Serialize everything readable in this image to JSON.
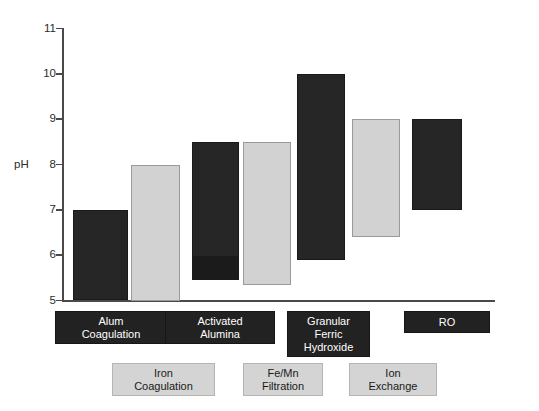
{
  "chart_data": {
    "type": "bar",
    "title": "",
    "subtitle": "",
    "xlabel": "",
    "ylabel": "pH",
    "ylim": [
      5,
      11
    ],
    "yticks": [
      5,
      6,
      7,
      8,
      9,
      10,
      11
    ],
    "ytick_labels": [
      "5",
      "6",
      "7",
      "8",
      "9",
      "10",
      "11"
    ],
    "grid": false,
    "legend_position": "below-axis",
    "note": "Floating/range bars: each bar spans an operating pH range (low to high) for a water-treatment process.",
    "categories": [
      "Alum Coagulation",
      "Iron Coagulation",
      "Activated Alumina",
      "Fe/Mn Filtration",
      "Granular Ferric Hydroxide",
      "Ion Exchange",
      "RO"
    ],
    "series": [
      {
        "name": "pH range low",
        "values": [
          5.0,
          5.0,
          5.45,
          5.35,
          5.9,
          6.4,
          7.0
        ]
      },
      {
        "name": "pH range high",
        "values": [
          7.0,
          8.0,
          8.5,
          8.5,
          10.0,
          9.0,
          9.0
        ]
      }
    ],
    "bars": [
      {
        "label": "Alum Coagulation",
        "low": 5.0,
        "high": 7.0,
        "shade": "dark",
        "legend_row": "top"
      },
      {
        "label": "Iron Coagulation",
        "low": 5.0,
        "high": 8.0,
        "shade": "light",
        "legend_row": "bottom"
      },
      {
        "label": "Activated Alumina",
        "low": 5.45,
        "high": 8.5,
        "shade": "dark",
        "legend_row": "top"
      },
      {
        "label": "Fe/Mn Filtration",
        "low": 5.35,
        "high": 8.5,
        "shade": "light",
        "legend_row": "bottom"
      },
      {
        "label": "Granular Ferric Hydroxide",
        "low": 5.9,
        "high": 10.0,
        "shade": "dark",
        "legend_row": "top"
      },
      {
        "label": "Ion Exchange",
        "low": 6.4,
        "high": 9.0,
        "shade": "light",
        "legend_row": "bottom"
      },
      {
        "label": "RO",
        "low": 7.0,
        "high": 9.0,
        "shade": "dark",
        "legend_row": "top"
      }
    ]
  },
  "axis": {
    "y_title": "pH",
    "ticks": [
      {
        "value": "11"
      },
      {
        "value": "10"
      },
      {
        "value": "9"
      },
      {
        "value": "8"
      },
      {
        "value": "7"
      },
      {
        "value": "6"
      },
      {
        "value": "5"
      }
    ]
  },
  "legend": {
    "top_row": [
      {
        "lines": [
          "Alum",
          "Coagulation"
        ]
      },
      {
        "lines": [
          "Activated",
          "Alumina"
        ]
      },
      {
        "lines": [
          "Granular",
          "Ferric",
          "Hydroxide"
        ]
      },
      {
        "lines": [
          "RO"
        ]
      }
    ],
    "bottom_row": [
      {
        "lines": [
          "Iron",
          "Coagulation"
        ]
      },
      {
        "lines": [
          "Fe/Mn",
          "Filtration"
        ]
      },
      {
        "lines": [
          "Ion",
          "Exchange"
        ]
      }
    ]
  },
  "colors": {
    "bar_dark": "#262626",
    "bar_light": "#d2d2d2",
    "axis": "#4a4a4a",
    "text": "#2b2b2b",
    "background": "#ffffff"
  }
}
